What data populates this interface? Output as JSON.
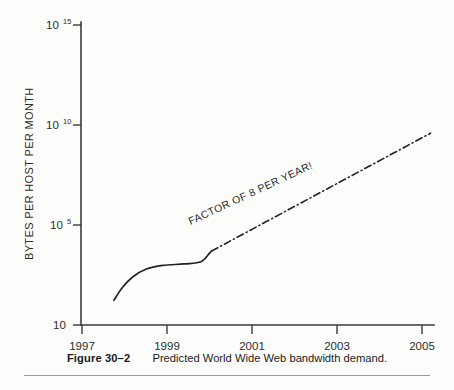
{
  "figure": {
    "caption_label": "Figure 30–2",
    "caption_text": "Predicted World Wide Web bandwidth demand."
  },
  "chart_data": {
    "type": "line",
    "title": "Predicted World Wide Web bandwidth demand.",
    "xlabel": "",
    "ylabel": "BYTES PER HOST PER MONTH",
    "xlim": [
      1997,
      2005.4
    ],
    "ylim_log10": [
      1,
      15
    ],
    "yscale": "log",
    "grid": false,
    "legend": "none",
    "xticks": [
      1997,
      1999,
      2001,
      2003,
      2005
    ],
    "xticklabels": [
      "1997",
      "1999",
      "2001",
      "2003",
      "2005"
    ],
    "yticks_log10": [
      1,
      5,
      10,
      15
    ],
    "yticklabels": [
      "10",
      "10⁵",
      "10¹⁰",
      "10¹⁵"
    ],
    "yticklabels_parts": [
      {
        "base": "10",
        "exp": ""
      },
      {
        "base": "10",
        "exp": "5"
      },
      {
        "base": "10",
        "exp": "10"
      },
      {
        "base": "10",
        "exp": "15"
      }
    ],
    "annotations": [
      {
        "text": "FACTOR OF 8 PER YEAR!",
        "x": 2001.0,
        "y_log10": 7.0,
        "rotation_deg": -25
      }
    ],
    "series": [
      {
        "name": "historical",
        "style": "solid",
        "points": [
          {
            "x": 1997.75,
            "y_log10": 2.15
          },
          {
            "x": 1997.95,
            "y_log10": 2.75
          },
          {
            "x": 1998.2,
            "y_log10": 3.25
          },
          {
            "x": 1998.5,
            "y_log10": 3.6
          },
          {
            "x": 1998.9,
            "y_log10": 3.78
          },
          {
            "x": 1999.4,
            "y_log10": 3.85
          },
          {
            "x": 1999.8,
            "y_log10": 3.95
          },
          {
            "x": 2000.0,
            "y_log10": 4.35
          },
          {
            "x": 2000.05,
            "y_log10": 4.45
          }
        ]
      },
      {
        "name": "projection",
        "style": "dash-dot",
        "points": [
          {
            "x": 2000.05,
            "y_log10": 4.45
          },
          {
            "x": 2005.2,
            "y_log10": 9.95
          }
        ],
        "growth_factor_per_year": 8
      }
    ]
  },
  "axes": {
    "y_title": "BYTES PER HOST PER MONTH"
  }
}
